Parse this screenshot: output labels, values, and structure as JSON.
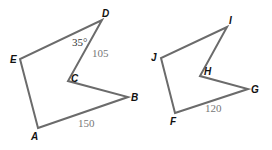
{
  "figure": {
    "polygon1": {
      "vertices": [
        {
          "name": "A",
          "x": 38,
          "y": 128
        },
        {
          "name": "B",
          "x": 128,
          "y": 97
        },
        {
          "name": "C",
          "x": 68,
          "y": 81
        },
        {
          "name": "D",
          "x": 102,
          "y": 20
        },
        {
          "name": "E",
          "x": 20,
          "y": 59
        }
      ],
      "labels": {
        "A": "A",
        "B": "B",
        "C": "C",
        "D": "D",
        "E": "E"
      },
      "measures": {
        "AB": "150",
        "CD": "105",
        "angle_D": "35°"
      }
    },
    "polygon2": {
      "vertices": [
        {
          "name": "F",
          "x": 175,
          "y": 113
        },
        {
          "name": "G",
          "x": 248,
          "y": 89
        },
        {
          "name": "H",
          "x": 200,
          "y": 76
        },
        {
          "name": "I",
          "x": 227,
          "y": 27
        },
        {
          "name": "J",
          "x": 161,
          "y": 58
        }
      ],
      "labels": {
        "F": "F",
        "G": "G",
        "H": "H",
        "I": "I",
        "J": "J"
      },
      "measures": {
        "FG": "120"
      }
    },
    "colors": {
      "edge": "#6b6b6b",
      "measure_text": "#777777",
      "vertex_text": "#111111"
    }
  }
}
